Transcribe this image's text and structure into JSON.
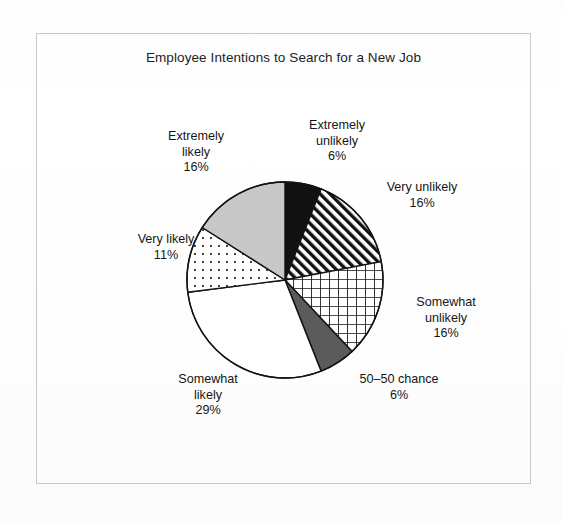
{
  "chart_data": {
    "type": "pie",
    "title": "Employee Intentions to Search for a New Job",
    "xlabel": "",
    "ylabel": "",
    "legend": "none",
    "grid": false,
    "start_angle_deg": 0,
    "direction": "clockwise",
    "categories": [
      "Extremely unlikely",
      "Very unlikely",
      "Somewhat unlikely",
      "50–50 chance",
      "Somewhat likely",
      "Very likely",
      "Extremely likely"
    ],
    "values": [
      6,
      16,
      16,
      6,
      29,
      11,
      16
    ],
    "units": "percent",
    "slices": [
      {
        "label": "Extremely unlikely",
        "label_line1": "Extremely",
        "label_line2": "unlikely",
        "value": 6,
        "percent_text": "6%",
        "fill": "solid-black",
        "color": "#111111"
      },
      {
        "label": "Very unlikely",
        "label_line1": "Very unlikely",
        "label_line2": "",
        "value": 16,
        "percent_text": "16%",
        "fill": "diagonal-stripes",
        "color": "#111111"
      },
      {
        "label": "Somewhat unlikely",
        "label_line1": "Somewhat",
        "label_line2": "unlikely",
        "value": 16,
        "percent_text": "16%",
        "fill": "cross-hatch-grid",
        "color": "#111111"
      },
      {
        "label": "50–50 chance",
        "label_line1": "50–50 chance",
        "label_line2": "",
        "value": 6,
        "percent_text": "6%",
        "fill": "solid-dark-gray",
        "color": "#5b5b5b"
      },
      {
        "label": "Somewhat likely",
        "label_line1": "Somewhat",
        "label_line2": "likely",
        "value": 29,
        "percent_text": "29%",
        "fill": "solid-white",
        "color": "#ffffff"
      },
      {
        "label": "Very likely",
        "label_line1": "Very likely",
        "label_line2": "",
        "value": 11,
        "percent_text": "11%",
        "fill": "dotted",
        "color": "#ffffff"
      },
      {
        "label": "Extremely likely",
        "label_line1": "Extremely",
        "label_line2": "likely",
        "value": 16,
        "percent_text": "16%",
        "fill": "solid-light-gray",
        "color": "#c8c8c8"
      }
    ]
  },
  "figure": {
    "title": "Employee Intentions to Search for a New Job",
    "border_color": "#c9c9c9",
    "background": "#ffffff",
    "outline_color": "#111111"
  }
}
